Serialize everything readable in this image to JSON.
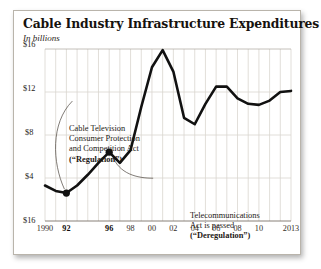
{
  "chart_data": {
    "type": "line",
    "title": "Cable Industry Infrastructure Expenditures",
    "subtitle": "In billions",
    "xlabel": "",
    "ylabel": "",
    "ylim": [
      0,
      16
    ],
    "xlim": [
      1990,
      2013
    ],
    "grid": "vertical gridlines at every year; horizontal gridlines at $4, $8, $12, $16",
    "legend": "none",
    "y_ticks": [
      "$16",
      "$12",
      "$8",
      "$4",
      "$16"
    ],
    "y_tick_values": [
      16,
      12,
      8,
      4,
      0
    ],
    "x_ticks": [
      "1990",
      "92",
      "96",
      "98",
      "00",
      "02",
      "04",
      "06",
      "08",
      "10",
      "2013"
    ],
    "x_tick_values": [
      1990,
      1992,
      1996,
      1998,
      2000,
      2002,
      2004,
      2006,
      2008,
      2010,
      2013
    ],
    "x_ticks_bold": [
      "92",
      "96"
    ],
    "x": [
      1990,
      1991,
      1992,
      1993,
      1994,
      1995,
      1996,
      1997,
      1998,
      1999,
      2000,
      2001,
      2002,
      2003,
      2004,
      2005,
      2006,
      2007,
      2008,
      2009,
      2010,
      2011,
      2012,
      2013
    ],
    "values": [
      3.3,
      2.8,
      2.6,
      3.3,
      4.3,
      5.4,
      6.4,
      5.4,
      6.6,
      10.6,
      14.3,
      15.9,
      13.9,
      9.6,
      9.0,
      10.9,
      12.5,
      12.5,
      11.4,
      10.9,
      10.8,
      11.2,
      12.0,
      12.1
    ],
    "markers": [
      {
        "x": 1992,
        "y": 2.6,
        "label": "Regulation"
      },
      {
        "x": 1996,
        "y": 6.4,
        "label": "Deregulation"
      }
    ],
    "annotations": [
      {
        "id": "regulation",
        "lines": [
          "Cable Television",
          "Consumer Protection",
          "and Competition Act"
        ],
        "bold_line": "(“Regulation”)",
        "points_to_year": 1992
      },
      {
        "id": "deregulation",
        "lines": [
          "Telecommunications",
          "Act is passed"
        ],
        "bold_line": "(“Deregulation”)",
        "points_to_year": 1996
      }
    ]
  },
  "colors": {
    "line": "#111111",
    "grid": "#d9d5cf",
    "axis": "#7a736a",
    "card_border": "#b9b4ab",
    "text": "#16120e",
    "background": "#ffffff"
  }
}
